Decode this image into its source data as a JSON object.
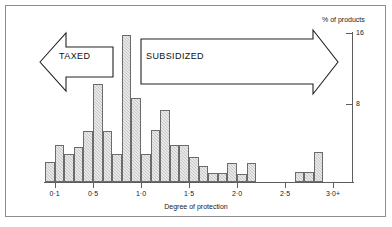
{
  "figure": {
    "top_crop_sliver": "",
    "xaxis_title": "Degree of protection",
    "yaxis_title": "% of products",
    "ytick_labels": [
      "16",
      "8"
    ],
    "xtick_labels": [
      "0·1",
      "0·5",
      "1·0",
      "1·5",
      "2·0",
      "2·5",
      "3·0+"
    ],
    "annotations": {
      "left_arrow_label": "TAXED",
      "right_arrow_label": "SUBSIDIZED"
    }
  },
  "chart_data": {
    "type": "bar",
    "title": "",
    "subtitle": "",
    "xlabel": "Degree of protection",
    "ylabel": "% of products",
    "ylim": [
      0,
      17
    ],
    "xlim": [
      0.0,
      3.1
    ],
    "grid": false,
    "legend": null,
    "bin_width": 0.1,
    "ytick_values": [
      8,
      16
    ],
    "ytick_labels": [
      "8",
      "16"
    ],
    "xtick_values": [
      0.1,
      0.5,
      1.0,
      1.5,
      2.0,
      2.5,
      3.0
    ],
    "xtick_labels": [
      "0·1",
      "0·5",
      "1·0",
      "1·5",
      "2·0",
      "2·5",
      "3·0+"
    ],
    "categories": [
      "0.1",
      "0.2",
      "0.3",
      "0.4",
      "0.5",
      "0.6",
      "0.7",
      "0.8",
      "0.9",
      "1.0",
      "1.1",
      "1.2",
      "1.3",
      "1.4",
      "1.5",
      "1.6",
      "1.7",
      "1.8",
      "1.9",
      "2.0",
      "2.1",
      "2.2",
      "2.3",
      "2.4",
      "2.5",
      "2.6",
      "2.7",
      "2.8",
      "2.9",
      "3.0"
    ],
    "values": [
      2.2,
      4.0,
      3.0,
      3.8,
      5.5,
      10.5,
      5.5,
      3.0,
      15.8,
      9.0,
      3.0,
      5.6,
      7.7,
      4.0,
      4.0,
      2.7,
      1.7,
      1.0,
      1.0,
      2.0,
      0.9,
      2.0,
      0,
      0,
      0,
      0,
      1.1,
      1.1,
      3.2,
      0
    ],
    "annotations": [
      {
        "text": "TAXED",
        "direction": "left",
        "x_range": [
          0.1,
          0.85
        ]
      },
      {
        "text": "SUBSIDIZED",
        "direction": "right",
        "x_range": [
          0.95,
          3.05
        ]
      }
    ]
  },
  "colors": {
    "bar_fill": "#c9c9c9",
    "bar_stroke": "#6b6b6b",
    "axis": "#5d5d5d",
    "frame": "#8d8d8d",
    "text": "#1a1a1a",
    "background": "#ffffff"
  }
}
